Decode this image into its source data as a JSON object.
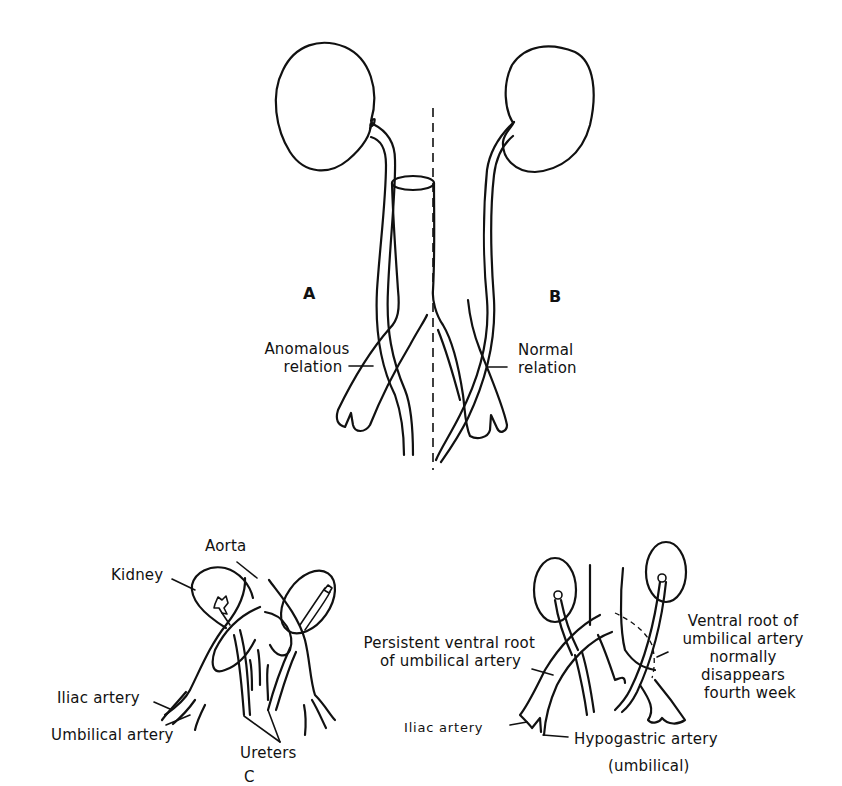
{
  "figure": {
    "panel_a": {
      "letter": "A",
      "label_line1": "Anomalous",
      "label_line2": "relation"
    },
    "panel_b": {
      "letter": "B",
      "label_line1": "Normal",
      "label_line2": "relation"
    },
    "panel_c": {
      "letter": "C",
      "aorta": "Aorta",
      "kidney": "Kidney",
      "iliac_artery": "Iliac artery",
      "umbilical_artery": "Umbilical artery",
      "ureters": "Ureters"
    },
    "panel_d": {
      "persistent_line1": "Persistent ventral root",
      "persistent_line2": "of umbilical artery",
      "ventral_line1": "Ventral root of",
      "ventral_line2": "umbilical artery",
      "ventral_line3": "normally",
      "ventral_line4": "disappears",
      "ventral_line5": "fourth week",
      "iliac_artery": "Iliac artery",
      "hypogastric_line1": "Hypogastric artery",
      "hypogastric_line2": "(umbilical)"
    },
    "colors": {
      "ink": "#111111",
      "paper": "#ffffff"
    }
  }
}
